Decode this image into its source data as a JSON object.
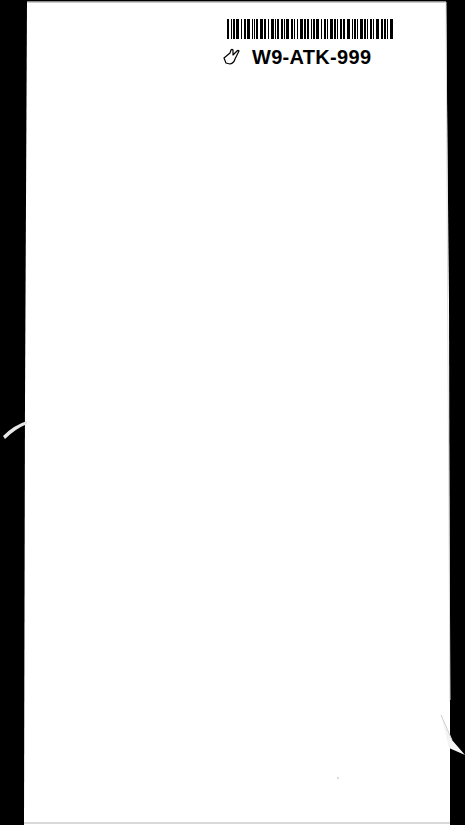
{
  "document": {
    "type": "scanned-blank-page",
    "label": {
      "barcode_present": true,
      "catalog_number": "W9-ATK-999",
      "icon": "hand-pointer-icon"
    },
    "colors": {
      "page": "#ffffff",
      "background": "#000000",
      "ink": "#000000"
    }
  }
}
